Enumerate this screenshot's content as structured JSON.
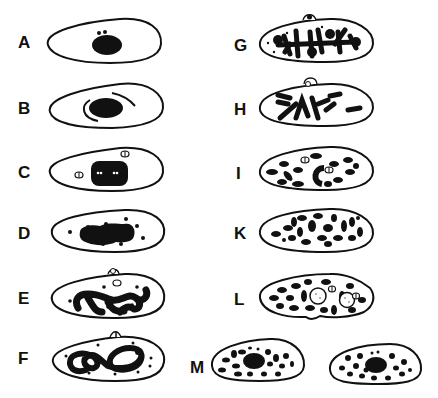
{
  "figure": {
    "panels": [
      {
        "id": "A",
        "label": "A",
        "column": "left"
      },
      {
        "id": "B",
        "label": "B",
        "column": "left"
      },
      {
        "id": "C",
        "label": "C",
        "column": "left"
      },
      {
        "id": "D",
        "label": "D",
        "column": "left"
      },
      {
        "id": "E",
        "label": "E",
        "column": "left"
      },
      {
        "id": "F",
        "label": "F",
        "column": "left"
      },
      {
        "id": "G",
        "label": "G",
        "column": "right"
      },
      {
        "id": "H",
        "label": "H",
        "column": "right"
      },
      {
        "id": "I",
        "label": "I",
        "column": "right"
      },
      {
        "id": "K",
        "label": "K",
        "column": "right"
      },
      {
        "id": "L",
        "label": "L",
        "column": "right"
      },
      {
        "id": "M",
        "label": "M",
        "column": "bottom",
        "cells": 2
      }
    ],
    "colors": {
      "ink": "#111111",
      "background": "#ffffff"
    }
  }
}
